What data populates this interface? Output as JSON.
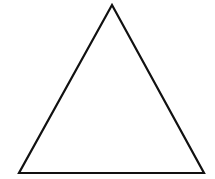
{
  "diagram": {
    "shape": "triangle",
    "type": "equilateral-outline",
    "stroke_color": "#111111",
    "fill_color": "#ffffff",
    "stroke_width": 2.2,
    "vertices": {
      "apex": [
        112,
        5
      ],
      "bottom_left": [
        19,
        173
      ],
      "bottom_right": [
        204,
        173
      ]
    }
  }
}
